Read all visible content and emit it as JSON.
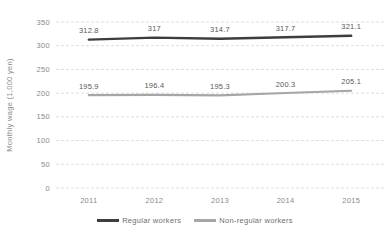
{
  "chart_data": {
    "type": "line",
    "title": "",
    "xlabel": "",
    "ylabel": "Monthly wage (1,000 yen)",
    "categories": [
      "2011",
      "2012",
      "2013",
      "2014",
      "2015"
    ],
    "series": [
      {
        "id": "regular",
        "name": "Regular workers",
        "values": [
          312.8,
          317,
          314.7,
          317.7,
          321.1
        ],
        "color": "#3d3d3d"
      },
      {
        "id": "non-regular",
        "name": "Non-regular workers",
        "values": [
          195.9,
          196.4,
          195.3,
          200.3,
          205.1
        ],
        "color": "#a6a6a6"
      }
    ],
    "ylim": [
      0,
      350
    ],
    "yticks": [
      0,
      50,
      100,
      150,
      200,
      250,
      300,
      350
    ],
    "grid": "horizontal-dashed",
    "legend_position": "bottom",
    "data_labels": true,
    "colors": {
      "background": "#ffffff",
      "grid": "#dedede",
      "axis_text": "#8a8a8a",
      "data_label_text": "#595959",
      "legend_text": "#6e6e6e"
    }
  }
}
